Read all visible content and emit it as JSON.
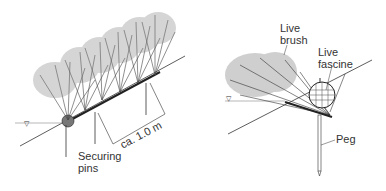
{
  "left_diagram": {
    "title": "Live brush layer with securing pins",
    "labels": {
      "securing_pins": "Securing\npins",
      "spacing": "ca. 1.0 m"
    },
    "water_level_symbol": "▽"
  },
  "right_diagram": {
    "title": "Live brush with live fascine and peg",
    "labels": {
      "live_brush": "Live\nbrush",
      "live_fascine": "Live\nfascine",
      "peg": "Peg"
    },
    "water_level_symbol": "▽"
  },
  "colors": {
    "ink": "#333333",
    "shrub": "#555555",
    "background": "#ffffff"
  }
}
